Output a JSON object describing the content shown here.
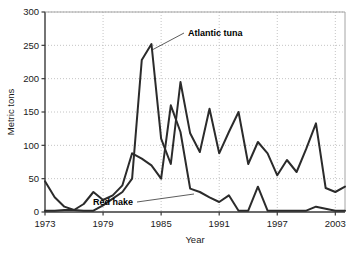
{
  "chart_data": {
    "type": "line",
    "title": "",
    "xlabel": "Year",
    "ylabel": "Metric tons",
    "xlim": [
      1973,
      2004
    ],
    "ylim": [
      0,
      300
    ],
    "ytick_values": [
      0,
      50,
      100,
      150,
      200,
      250,
      300
    ],
    "ytick_labels": [
      "0",
      "50",
      "100",
      "150",
      "200",
      "250",
      "300"
    ],
    "xtick_values": [
      1973,
      1979,
      1985,
      1991,
      1997,
      2003
    ],
    "xtick_labels": [
      "1973",
      "1979",
      "1985",
      "1991",
      "1997",
      "2003"
    ],
    "grid": "dotted",
    "legend_position": "inline-annotations",
    "line_color": "#2b2b2b",
    "x": [
      1973,
      1974,
      1975,
      1976,
      1977,
      1978,
      1979,
      1980,
      1981,
      1982,
      1983,
      1984,
      1985,
      1986,
      1987,
      1988,
      1989,
      1990,
      1991,
      1992,
      1993,
      1994,
      1995,
      1996,
      1997,
      1998,
      1999,
      2000,
      2001,
      2002,
      2003,
      2004
    ],
    "series": [
      {
        "name": "Atlantic tuna",
        "label": "Atlantic tuna",
        "values": [
          2,
          2,
          3,
          3,
          2,
          2,
          10,
          20,
          30,
          50,
          228,
          252,
          110,
          72,
          195,
          118,
          90,
          155,
          88,
          120,
          150,
          72,
          105,
          88,
          55,
          78,
          60,
          95,
          133,
          36,
          30,
          38
        ]
      },
      {
        "name": "Red hake",
        "label": "Red hake",
        "values": [
          46,
          22,
          8,
          3,
          12,
          30,
          18,
          25,
          40,
          88,
          80,
          70,
          50,
          160,
          120,
          35,
          30,
          22,
          15,
          25,
          2,
          2,
          38,
          2,
          2,
          2,
          2,
          2,
          8,
          5,
          2,
          2
        ]
      }
    ],
    "annotations": [
      {
        "name": "Atlantic tuna",
        "text": "Atlantic tuna",
        "label_x": 188,
        "label_y": 36,
        "point_x": 152,
        "point_y": 50
      },
      {
        "name": "Red hake",
        "text": "Red hake",
        "label_x": 133,
        "label_y": 205,
        "point_x": 194,
        "point_y": 194
      }
    ]
  }
}
